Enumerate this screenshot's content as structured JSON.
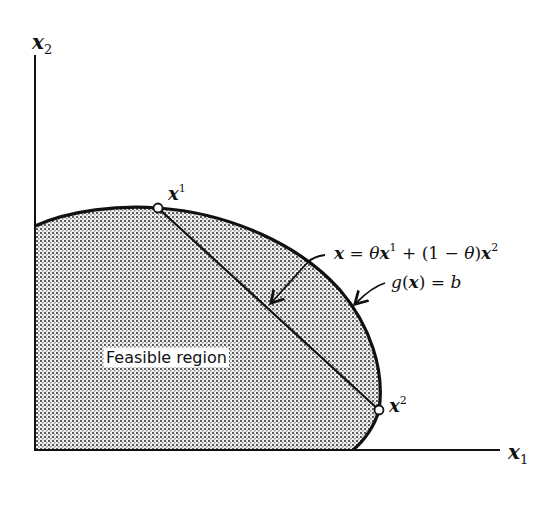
{
  "diagram": {
    "title": "",
    "axes": {
      "y_label": {
        "var": "x",
        "sub": "2"
      },
      "x_label": {
        "var": "x",
        "sub": "1"
      }
    },
    "points": [
      {
        "id": "x1",
        "var": "x",
        "sup": "1"
      },
      {
        "id": "x2",
        "var": "x",
        "sup": "2"
      }
    ],
    "region_label": "Feasible region",
    "annotations": {
      "convex_combination": {
        "lhs": "x",
        "eq": " = ",
        "theta": "θ",
        "x1": "x",
        "x1_sup": "1",
        "plus": " + (1 − ",
        "theta2": "θ",
        "close": ")",
        "x2": "x",
        "x2_sup": "2"
      },
      "boundary": {
        "g": "g",
        "open": "(",
        "x": "x",
        "close": ")",
        "eq": " = ",
        "b": "b"
      }
    },
    "colors": {
      "line": "#111111",
      "fill_dots": "#555555",
      "background": "#ffffff"
    }
  }
}
